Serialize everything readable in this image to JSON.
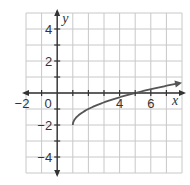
{
  "chart_data": {
    "type": "line",
    "title": "",
    "xlabel": "x",
    "ylabel": "y",
    "xlim": [
      -2,
      8
    ],
    "ylim": [
      -5,
      5
    ],
    "grid": true,
    "x_tick_labels": [
      "-2",
      "0",
      "4",
      "6"
    ],
    "y_tick_labels": [
      "4",
      "2",
      "-2",
      "-4"
    ],
    "function": "y = sqrt(x - 1) - 2",
    "series": [
      {
        "name": "curve",
        "x": [
          1,
          1.25,
          1.5,
          2,
          3,
          4,
          5,
          6,
          7,
          8
        ],
        "y": [
          -2,
          -1.5,
          -1.29,
          -1,
          -0.59,
          -0.27,
          0,
          0.24,
          0.45,
          0.65
        ],
        "start_point": [
          1,
          -2
        ],
        "end_arrow": true
      }
    ],
    "colors": {
      "grid": "#c8c8c8",
      "axes": "#333333",
      "curve": "#555555"
    }
  },
  "labels": {
    "x_axis": "x",
    "y_axis": "y",
    "x_ticks": [
      {
        "text": "−2",
        "value": -2
      },
      {
        "text": "0",
        "value": 0
      },
      {
        "text": "4",
        "value": 4
      },
      {
        "text": "6",
        "value": 6
      }
    ],
    "y_ticks": [
      {
        "text": "4",
        "value": 4
      },
      {
        "text": "2",
        "value": 2
      },
      {
        "text": "−2",
        "value": -2
      },
      {
        "text": "−4",
        "value": -4
      }
    ]
  }
}
